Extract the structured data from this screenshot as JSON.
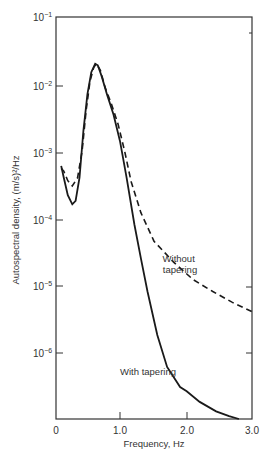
{
  "chart_data": {
    "type": "line",
    "title": "",
    "xlabel": "Frequency, Hz",
    "ylabel": "Autospectral density, (m/s)²/Hz",
    "xlim": [
      0,
      3.0
    ],
    "ylim": [
      1e-07,
      0.1
    ],
    "yscale": "log",
    "grid": false,
    "x_ticks": [
      "0",
      "1.0",
      "2.0",
      "3.0"
    ],
    "y_ticks": [
      {
        "base": "10",
        "exp": "−1"
      },
      {
        "base": "10",
        "exp": "−2"
      },
      {
        "base": "10",
        "exp": "−3"
      },
      {
        "base": "10",
        "exp": "−4"
      },
      {
        "base": "10",
        "exp": "−5"
      },
      {
        "base": "10",
        "exp": "−6"
      }
    ],
    "series": [
      {
        "name": "Without tapering",
        "style": "dashed",
        "x": [
          0.08,
          0.12,
          0.18,
          0.25,
          0.33,
          0.4,
          0.46,
          0.52,
          0.58,
          0.62,
          0.68,
          0.75,
          0.85,
          0.95,
          1.05,
          1.15,
          1.3,
          1.5,
          1.8,
          2.1,
          2.4,
          2.7,
          3.0
        ],
        "y": [
          0.00055,
          0.0005,
          0.00036,
          0.0003,
          0.0004,
          0.001,
          0.004,
          0.011,
          0.018,
          0.02,
          0.016,
          0.009,
          0.005,
          0.0025,
          0.001,
          0.00035,
          0.00012,
          4.5e-05,
          2.2e-05,
          1.2e-05,
          8e-06,
          5.5e-06,
          4e-06
        ]
      },
      {
        "name": "With tapering",
        "style": "solid",
        "x": [
          0.08,
          0.12,
          0.18,
          0.25,
          0.3,
          0.36,
          0.42,
          0.48,
          0.54,
          0.6,
          0.64,
          0.7,
          0.78,
          0.88,
          0.98,
          1.08,
          1.2,
          1.3,
          1.4,
          1.55,
          1.7,
          1.9,
          2.0,
          2.2,
          2.45,
          2.65,
          2.8
        ],
        "y": [
          0.0006,
          0.0004,
          0.00022,
          0.00016,
          0.00018,
          0.0004,
          0.002,
          0.007,
          0.015,
          0.02,
          0.019,
          0.013,
          0.007,
          0.0035,
          0.0014,
          0.0004,
          8e-05,
          2.5e-05,
          8e-06,
          1.8e-06,
          6e-07,
          3e-07,
          2.6e-07,
          1.8e-07,
          1.3e-07,
          1.1e-07,
          1e-07
        ]
      }
    ],
    "annotations": [
      {
        "text_lines": [
          "Without",
          "tapering"
        ]
      },
      {
        "text_lines": [
          "With tapering"
        ]
      }
    ]
  }
}
